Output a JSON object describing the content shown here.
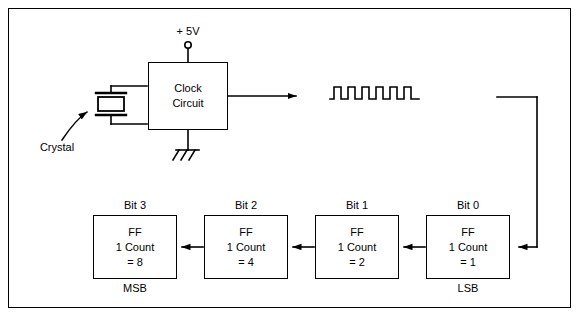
{
  "figure": {
    "background_color": "#ffffff",
    "line_color": "#000000",
    "width": 581,
    "height": 318
  },
  "power": {
    "label": "+ 5V",
    "terminal_icon": "open-circle-terminal"
  },
  "ground": {
    "icon": "chassis-ground-icon"
  },
  "crystal": {
    "label": "Crystal",
    "icon": "crystal-oscillator-icon",
    "pointer_icon": "curved-arrow-icon"
  },
  "clock": {
    "line1": "Clock",
    "line2": "Circuit",
    "output_icon": "arrow-right-icon"
  },
  "waveform": {
    "name": "square-wave",
    "pulses": 6,
    "description": "clock output square wave"
  },
  "counter": {
    "stages": [
      {
        "bit_label": "Bit 3",
        "line1": "FF",
        "line2": "1 Count",
        "line3": "= 8",
        "significance": "MSB"
      },
      {
        "bit_label": "Bit 2",
        "line1": "FF",
        "line2": "1 Count",
        "line3": "= 4",
        "significance": ""
      },
      {
        "bit_label": "Bit 1",
        "line1": "FF",
        "line2": "1 Count",
        "line3": "= 2",
        "significance": ""
      },
      {
        "bit_label": "Bit 0",
        "line1": "FF",
        "line2": "1 Count",
        "line3": "= 1",
        "significance": "LSB"
      }
    ]
  }
}
